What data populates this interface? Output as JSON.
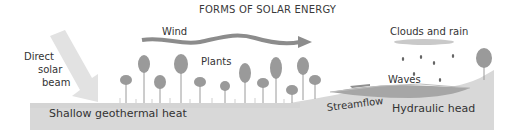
{
  "title": "FORMS OF SOLAR ENERGY",
  "labels": {
    "direct_solar_beam": [
      "Direct",
      "solar",
      "beam"
    ],
    "wind": "Wind",
    "plants": "Plants",
    "clouds_and_rain": "Clouds and rain",
    "waves": "Waves",
    "streamflow": "Streamflow",
    "hydraulic_head": "Hydraulic head",
    "shallow_geothermal_heat": "Shallow geothermal heat"
  },
  "colors": {
    "ground": "#d6d6d6",
    "ground_dark": "#c4c4c4",
    "water": "#a9a9a9",
    "tree": "#999999",
    "wind_arrow": "#8a8a8a",
    "solar_beam": "#e0e0e0",
    "cloud": "#c8c8c8",
    "rain": "#666666",
    "text": "#333333"
  }
}
